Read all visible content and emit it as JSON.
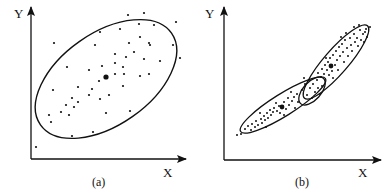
{
  "figure": {
    "colors": {
      "ink": "#111111",
      "background": "#ffffff"
    }
  },
  "panels": [
    {
      "id": "a",
      "caption": "(a)",
      "x_axis_label": "X",
      "y_axis_label": "Y",
      "ellipses": [
        {
          "name": "single-cluster-ellipse",
          "cx": 106,
          "cy": 79,
          "rx": 80,
          "ry": 47,
          "angle": -35
        }
      ],
      "centroids": [
        {
          "x": 106,
          "y": 77
        }
      ]
    },
    {
      "id": "b",
      "caption": "(b)",
      "x_axis_label": "X",
      "y_axis_label": "Y",
      "ellipses": [
        {
          "name": "lower-cluster-ellipse",
          "cx": 283,
          "cy": 105,
          "rx": 50,
          "ry": 11,
          "angle": -32
        },
        {
          "name": "upper-cluster-ellipse",
          "cx": 336,
          "cy": 62,
          "rx": 48,
          "ry": 12,
          "angle": -49
        },
        {
          "name": "overlap-ellipse",
          "cx": 312,
          "cy": 91,
          "rx": 17,
          "ry": 9,
          "angle": -48
        }
      ],
      "centroids": [
        {
          "x": 282,
          "y": 107
        },
        {
          "x": 331,
          "y": 66
        }
      ]
    }
  ]
}
